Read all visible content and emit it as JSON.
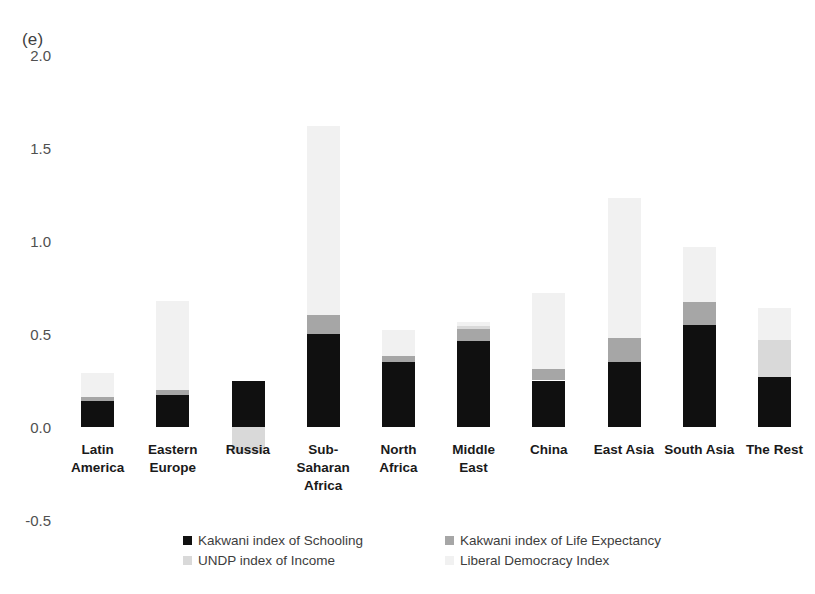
{
  "panel": {
    "label": "(e)"
  },
  "chart_data": {
    "type": "bar",
    "subtype": "stacked-bar",
    "title": "(e)",
    "xlabel": "",
    "ylabel": "",
    "ylim": [
      -0.5,
      2.0
    ],
    "ytick_labels": [
      "2.0",
      "1.5",
      "1.0",
      "0.5",
      "0.0",
      "-0.5"
    ],
    "ytick_values": [
      2.0,
      1.5,
      1.0,
      0.5,
      0.0,
      -0.5
    ],
    "grid": false,
    "legend_position": "bottom",
    "categories": [
      "Latin\nAmerica",
      "Eastern\nEurope",
      "Russia",
      "Sub-\nSaharan\nAfrica",
      "North\nAfrica",
      "Middle\nEast",
      "China",
      "East Asia",
      "South Asia",
      "The Rest"
    ],
    "series": [
      {
        "name": "Kakwani index of Schooling",
        "color": "#101010",
        "values": [
          0.14,
          0.17,
          0.25,
          0.5,
          0.35,
          0.465,
          0.25,
          0.35,
          0.55,
          0.27
        ]
      },
      {
        "name": "Kakwani index of Life Expectancy",
        "color": "#a6a6a6",
        "values": [
          0.02,
          0.03,
          0.0,
          0.1,
          0.03,
          0.06,
          0.06,
          0.13,
          0.12,
          0.0
        ]
      },
      {
        "name": "UNDP index of Income",
        "color": "#d9d9d9",
        "values": [
          0.0,
          0.0,
          -0.14,
          0.0,
          0.0,
          0.02,
          0.0,
          0.0,
          0.0,
          0.2
        ]
      },
      {
        "name": "Liberal Democracy Index",
        "color": "#f1f1f1",
        "values": [
          0.13,
          0.48,
          0.0,
          1.02,
          0.14,
          0.02,
          0.41,
          0.75,
          0.3,
          0.17
        ]
      }
    ],
    "totals_positive": [
      0.29,
      0.68,
      0.25,
      1.62,
      0.52,
      0.545,
      0.72,
      1.23,
      0.97,
      0.64
    ],
    "totals_negative": [
      0.0,
      0.0,
      -0.14,
      0.0,
      0.0,
      0.0,
      0.0,
      0.0,
      0.0,
      0.0
    ]
  },
  "legend": {
    "items": [
      {
        "label": "Kakwani index of Schooling",
        "color": "#101010"
      },
      {
        "label": "Kakwani index of Life Expectancy",
        "color": "#a6a6a6"
      },
      {
        "label": "UNDP index of Income",
        "color": "#d9d9d9"
      },
      {
        "label": "Liberal Democracy Index",
        "color": "#f1f1f1"
      }
    ]
  }
}
